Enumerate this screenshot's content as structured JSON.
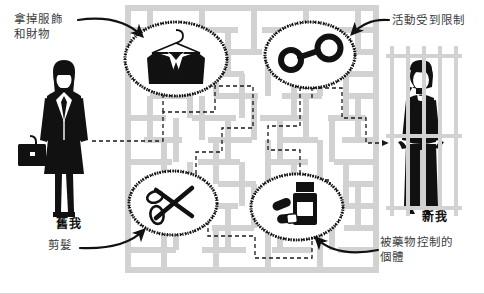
{
  "diagram": {
    "background_color": "#ffffff",
    "maze_wall_color": "#d2d2d2",
    "ink_color": "#111111",
    "label_color": "#3c3c3c"
  },
  "labels": {
    "remove_clothing": "拿掉服飾\n和財物",
    "restricted_activity": "活動受到限制",
    "haircut": "剪髮",
    "drug_controlled": "被藥物控制的\n個體",
    "old_self": "舊我",
    "new_self": "新我"
  },
  "nodes": [
    {
      "id": "suit",
      "icon": "suit-jacket-on-hanger-icon",
      "label": ""
    },
    {
      "id": "handcuffs",
      "icon": "handcuffs-icon",
      "label": ""
    },
    {
      "id": "scissors",
      "icon": "scissors-icon",
      "label": ""
    },
    {
      "id": "medicine",
      "icon": "pill-bottle-and-capsules-icon",
      "label": ""
    }
  ],
  "figures": {
    "left": {
      "icon": "businesswoman-with-briefcase-icon",
      "caption": "舊我"
    },
    "right": {
      "icon": "person-behind-bars-icon",
      "caption": "新我"
    }
  },
  "path": {
    "style": "dashed",
    "direction": "left-to-right",
    "has_arrowhead": true
  }
}
